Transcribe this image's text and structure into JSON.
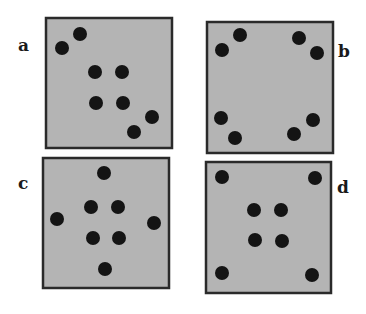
{
  "figure": {
    "background": "#ffffff",
    "panel_fill": "#b4b4b4",
    "panel_border": "#2a2a2a",
    "dot_color": "#141414",
    "panels": [
      {
        "label": "a",
        "label_pos": [
          18,
          51
        ],
        "box": [
          46,
          18,
          126,
          130
        ],
        "dots": [
          [
            80,
            34
          ],
          [
            62,
            48
          ],
          [
            95,
            72
          ],
          [
            122,
            72
          ],
          [
            96,
            103
          ],
          [
            123,
            103
          ],
          [
            152,
            117
          ],
          [
            134,
            132
          ]
        ]
      },
      {
        "label": "b",
        "label_pos": [
          338,
          57
        ],
        "box": [
          207,
          22,
          126,
          131
        ],
        "dots": [
          [
            240,
            35
          ],
          [
            222,
            50
          ],
          [
            299,
            38
          ],
          [
            317,
            53
          ],
          [
            221,
            118
          ],
          [
            235,
            138
          ],
          [
            313,
            120
          ],
          [
            294,
            134
          ]
        ]
      },
      {
        "label": "c",
        "label_pos": [
          18,
          189
        ],
        "box": [
          43,
          158,
          126,
          130
        ],
        "dots": [
          [
            104,
            173
          ],
          [
            91,
            207
          ],
          [
            118,
            207
          ],
          [
            57,
            219
          ],
          [
            154,
            223
          ],
          [
            93,
            238
          ],
          [
            119,
            238
          ],
          [
            105,
            269
          ]
        ]
      },
      {
        "label": "d",
        "label_pos": [
          337,
          193
        ],
        "box": [
          206,
          162,
          125,
          131
        ],
        "dots": [
          [
            222,
            177
          ],
          [
            315,
            178
          ],
          [
            254,
            210
          ],
          [
            281,
            210
          ],
          [
            255,
            240
          ],
          [
            282,
            241
          ],
          [
            222,
            273
          ],
          [
            312,
            275
          ]
        ]
      }
    ]
  }
}
